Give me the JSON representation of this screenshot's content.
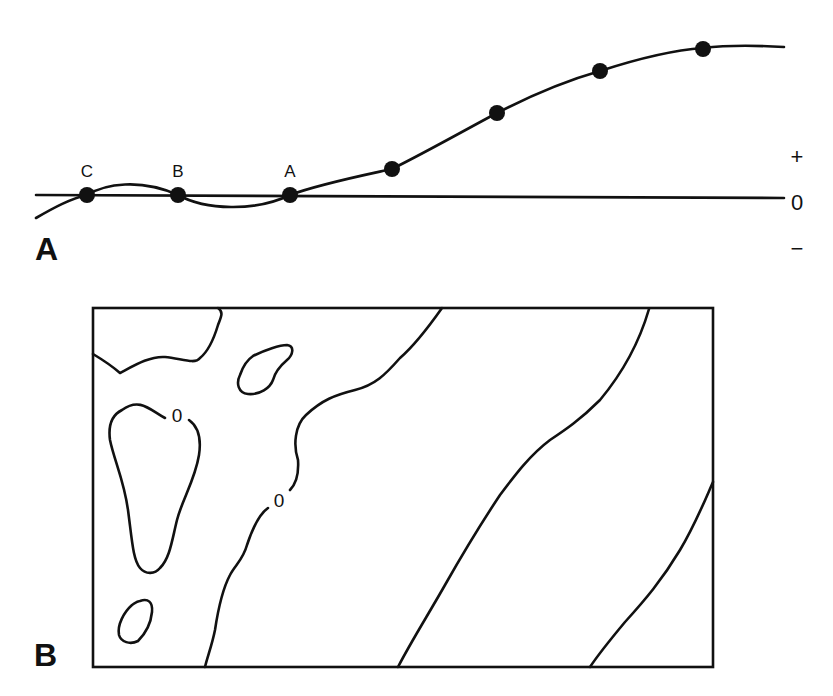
{
  "figure": {
    "panels": [
      {
        "id": "A",
        "label": "A",
        "type": "profile-curve",
        "baseline_label": "0",
        "positive_label": "+",
        "negative_label": "−",
        "points": [
          {
            "label": "C",
            "x": 87,
            "y": 196
          },
          {
            "label": "B",
            "x": 178,
            "y": 196
          },
          {
            "label": "A",
            "x": 290,
            "y": 196
          },
          {
            "label": "",
            "x": 392,
            "y": 169
          },
          {
            "label": "",
            "x": 497,
            "y": 113
          },
          {
            "label": "",
            "x": 600,
            "y": 71
          },
          {
            "label": "",
            "x": 703,
            "y": 49
          }
        ]
      },
      {
        "id": "B",
        "label": "B",
        "type": "contour-map",
        "contour_labels": [
          "0",
          "0"
        ]
      }
    ],
    "colors": {
      "ink": "#111111",
      "background": "#ffffff"
    }
  }
}
